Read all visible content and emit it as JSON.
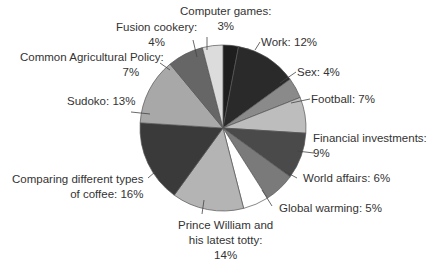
{
  "chart_data": {
    "type": "pie",
    "title": "",
    "center": [
      223,
      128
    ],
    "radius": 83,
    "start_angle_deg": 0,
    "direction": "clockwise",
    "slices": [
      {
        "label": "Computer games",
        "value": 3,
        "color": "#1e1e1e"
      },
      {
        "label": "Work",
        "value": 12,
        "color": "#2a2a2a"
      },
      {
        "label": "Sex",
        "value": 4,
        "color": "#8a8a8a"
      },
      {
        "label": "Football",
        "value": 7,
        "color": "#bdbdbd"
      },
      {
        "label": "Financial investments",
        "value": 9,
        "color": "#4a4a4a"
      },
      {
        "label": "World affairs",
        "value": 6,
        "color": "#7a7a7a"
      },
      {
        "label": "Global warming",
        "value": 5,
        "color": "#ffffff"
      },
      {
        "label": "Prince William and his latest totty",
        "value": 14,
        "color": "#b4b4b4"
      },
      {
        "label": "Comparing different types of coffee",
        "value": 16,
        "color": "#3a3a3a"
      },
      {
        "label": "Sudoko",
        "value": 13,
        "color": "#a8a8a8"
      },
      {
        "label": "Common Agricultural Policy",
        "value": 7,
        "color": "#666666"
      },
      {
        "label": "Fusion cookery",
        "value": 4,
        "color": "#dcdcdc"
      }
    ]
  },
  "labels": {
    "computer_games_1": "Computer games:",
    "computer_games_2": "3%",
    "fusion_1": "Fusion cookery:",
    "fusion_2": "4%",
    "cap_1": "Common Agricultural Policy:",
    "cap_2": "7%",
    "sudoko": "Sudoko: 13%",
    "coffee_1": "Comparing different types",
    "coffee_2": "of coffee: 16%",
    "prince_1": "Prince William and",
    "prince_2": "his latest totty:",
    "prince_3": "14%",
    "global": "Global warming: 5%",
    "world": "World affairs: 6%",
    "financial_1": "Financial investments:",
    "financial_2": "9%",
    "football": "Football: 7%",
    "sex": "Sex: 4%",
    "work": "Work: 12%"
  }
}
